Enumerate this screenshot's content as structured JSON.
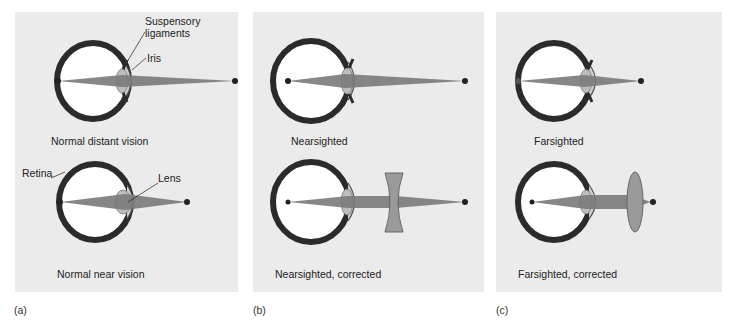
{
  "panels": [
    {
      "id": "a",
      "label": "(a)",
      "top_caption": "Normal distant vision",
      "bottom_caption": "Normal near vision",
      "annotations": {
        "suspensory_line1": "Suspensory",
        "suspensory_line2": "ligaments",
        "iris": "Iris",
        "retina": "Retina",
        "lens": "Lens"
      }
    },
    {
      "id": "b",
      "label": "(b)",
      "top_caption": "Nearsighted",
      "bottom_caption": "Nearsighted, corrected",
      "corrective_lens": "concave"
    },
    {
      "id": "c",
      "label": "(c)",
      "top_caption": "Farsighted",
      "bottom_caption": "Farsighted, corrected",
      "corrective_lens": "convex"
    }
  ],
  "colors": {
    "panel_bg": "#ebebeb",
    "eye_wall": "#2b2b2b",
    "light_beam": "#7a7a7a",
    "lens_fill": "#a8a8a8",
    "corrective_lens": "#9a9a9a"
  }
}
